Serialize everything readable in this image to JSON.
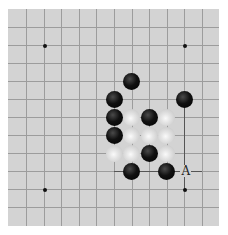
{
  "board": {
    "background": "#d3d3d3",
    "line_color": "#9c9c9c",
    "origin": {
      "x": 18,
      "y": 18
    },
    "spacing": {
      "x": 17.6,
      "y": 18
    },
    "columns": 11,
    "rows": 11,
    "star_points": [
      [
        1,
        1
      ],
      [
        9,
        1
      ],
      [
        1,
        9
      ],
      [
        9,
        9
      ]
    ],
    "stones": [
      {
        "color": "black",
        "col": 6,
        "row": 3
      },
      {
        "color": "black",
        "col": 5,
        "row": 4
      },
      {
        "color": "black",
        "col": 9,
        "row": 4
      },
      {
        "color": "black",
        "col": 5,
        "row": 5
      },
      {
        "color": "white",
        "col": 6,
        "row": 5
      },
      {
        "color": "black",
        "col": 7,
        "row": 5
      },
      {
        "color": "white",
        "col": 8,
        "row": 5
      },
      {
        "color": "black",
        "col": 5,
        "row": 6
      },
      {
        "color": "white",
        "col": 6,
        "row": 6
      },
      {
        "color": "white",
        "col": 7,
        "row": 6
      },
      {
        "color": "white",
        "col": 8,
        "row": 6
      },
      {
        "color": "white",
        "col": 5,
        "row": 7
      },
      {
        "color": "white",
        "col": 6,
        "row": 7
      },
      {
        "color": "black",
        "col": 7,
        "row": 7
      },
      {
        "color": "white",
        "col": 8,
        "row": 7
      },
      {
        "color": "black",
        "col": 6,
        "row": 8
      },
      {
        "color": "black",
        "col": 8,
        "row": 8
      }
    ],
    "labels": [
      {
        "text": "A",
        "col": 9,
        "row": 8
      }
    ]
  }
}
